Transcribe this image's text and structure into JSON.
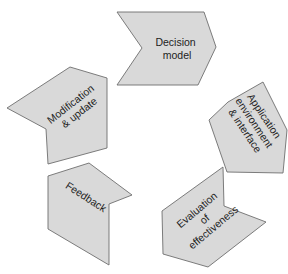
{
  "diagram": {
    "type": "cycle",
    "colors": {
      "fill": "#d9d9d9",
      "stroke": "#6e6e6e",
      "text": "#222222"
    },
    "steps": [
      {
        "id": "decision-model",
        "lines": [
          "Decision",
          "model"
        ]
      },
      {
        "id": "application",
        "lines": [
          "Application",
          "environment",
          "& interface"
        ]
      },
      {
        "id": "evaluation",
        "lines": [
          "Evaluation",
          "of",
          "effectiveness"
        ]
      },
      {
        "id": "feedback",
        "lines": [
          "Feedback"
        ]
      },
      {
        "id": "modification",
        "lines": [
          "Modification",
          "& update"
        ]
      }
    ]
  }
}
